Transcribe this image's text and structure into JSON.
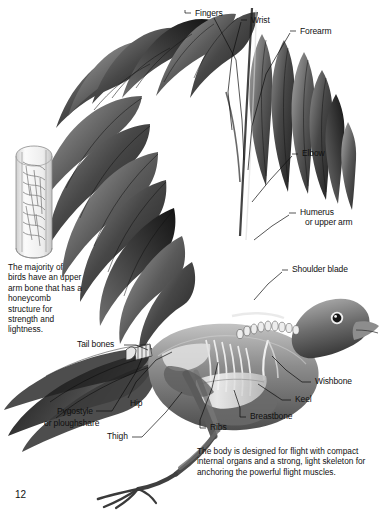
{
  "page": {
    "number": "12"
  },
  "labels": [
    {
      "id": "fingers",
      "text": "Fingers"
    },
    {
      "id": "wrist",
      "text": "Wrist"
    },
    {
      "id": "forearm",
      "text": "Forearm"
    },
    {
      "id": "elbow",
      "text": "Elbow"
    },
    {
      "id": "humerus",
      "text": "Humerus"
    },
    {
      "id": "humerus2",
      "text": "or upper arm"
    },
    {
      "id": "shoulder-blade",
      "text": "Shoulder blade"
    },
    {
      "id": "tail-bones",
      "text": "Tail bones"
    },
    {
      "id": "wishbone",
      "text": "Wishbone"
    },
    {
      "id": "keel",
      "text": "Keel"
    },
    {
      "id": "breastbone",
      "text": "Breastbone"
    },
    {
      "id": "ribs",
      "text": "Ribs"
    },
    {
      "id": "hip",
      "text": "Hip"
    },
    {
      "id": "thigh",
      "text": "Thigh"
    },
    {
      "id": "pygostyle",
      "text": "Pygostyle"
    },
    {
      "id": "ploughshare",
      "text": "or ploughshare"
    }
  ],
  "captions": {
    "bone_structure": "The majority of birds have an upper arm bone that has a honeycomb structure for strength and lightness.",
    "body_design": "The body is designed for flight with compact internal organs and a strong, light skeleton for anchoring the powerful flight muscles."
  },
  "figures": {
    "bone_cross_section": "honeycomb-bone-cutaway",
    "bird_skeleton": "bird-wing-skeleton-illustration"
  },
  "colors": {
    "background": "#ffffff",
    "text": "#101010",
    "leader_line": "#0d0d0d",
    "feather_dark": "#2c2c2c",
    "feather_mid": "#5e5e5e",
    "feather_light": "#9a9a9a",
    "body_mid": "#767676",
    "body_light": "#b8b8b8",
    "bone_white": "#efefef"
  }
}
